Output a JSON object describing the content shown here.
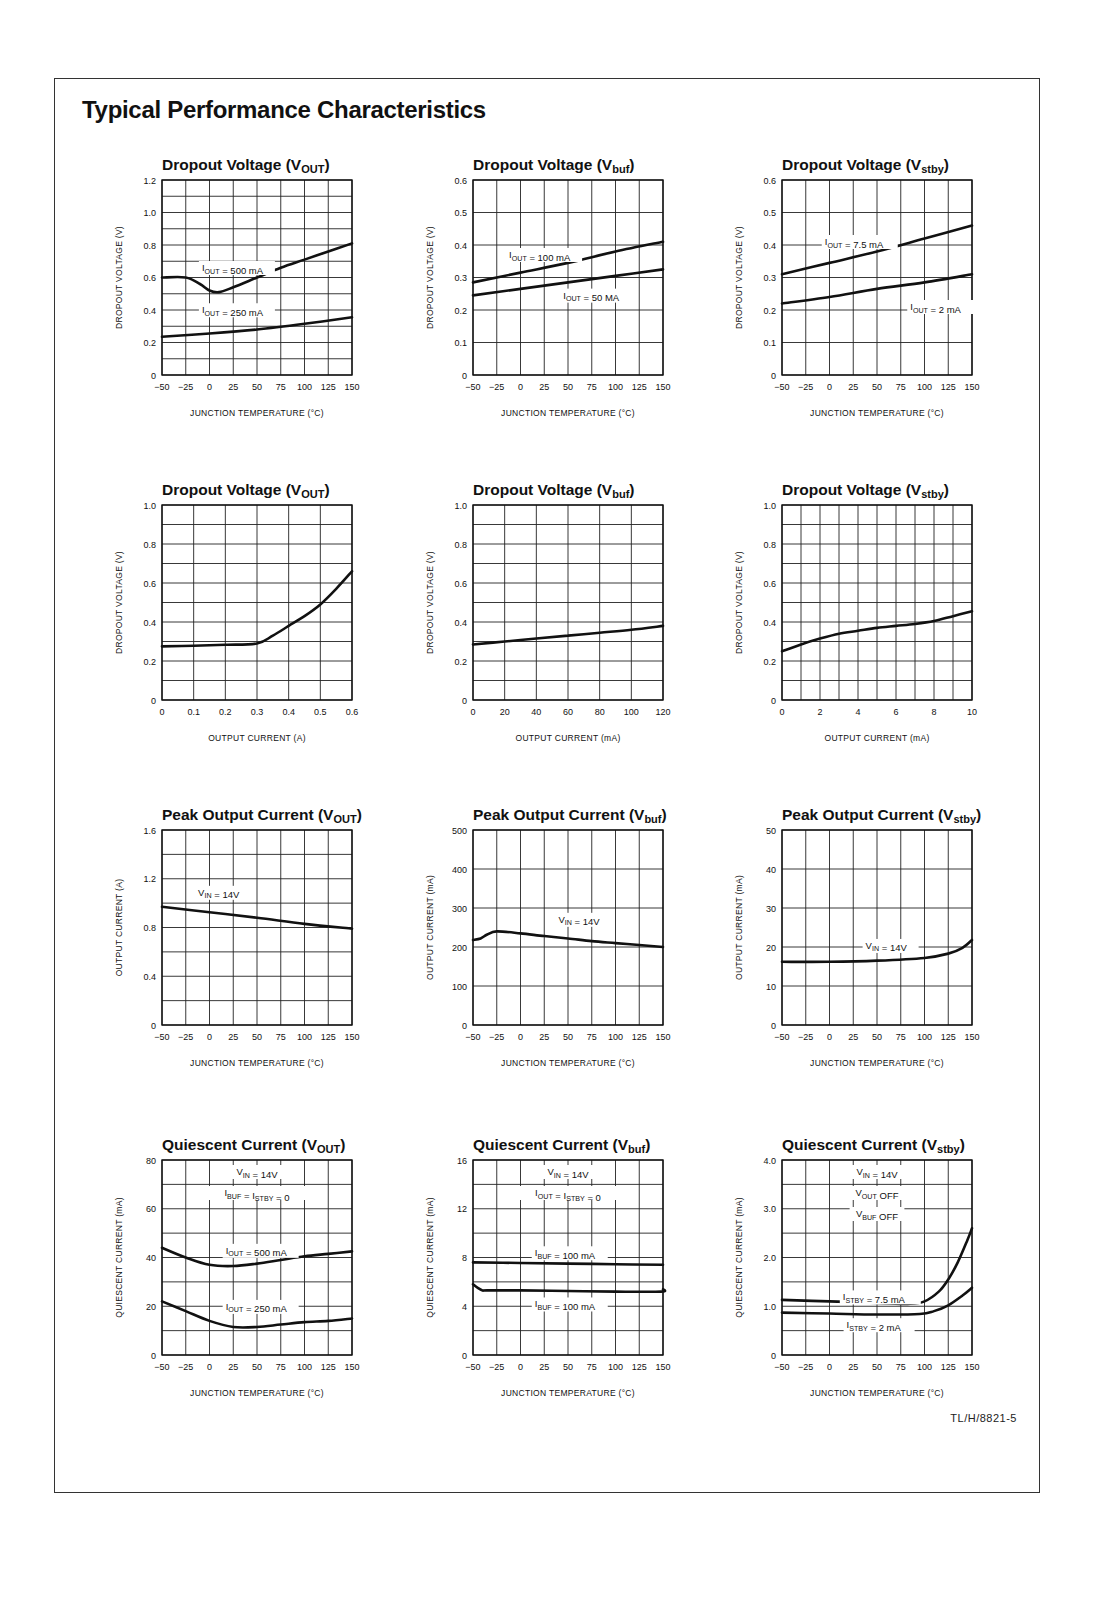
{
  "page": {
    "title": "Typical Performance Characteristics",
    "footer_code": "TL/H/8821-5"
  },
  "chart_data": [
    {
      "id": "dropout-vout-temp",
      "type": "line",
      "title": "Dropout Voltage (V_OUT)",
      "title_main": "Dropout Voltage (V",
      "title_sub": "OUT",
      "xlabel": "JUNCTION TEMPERATURE (°C)",
      "ylabel": "DROPOUT VOLTAGE (V)",
      "xlim": [
        -50,
        150
      ],
      "ylim": [
        0,
        1.2
      ],
      "xticks": [
        "-50",
        "-25",
        "0",
        "25",
        "50",
        "75",
        "100",
        "125",
        "150"
      ],
      "yticks": [
        "0",
        "0.2",
        "0.4",
        "0.6",
        "0.8",
        "1.0",
        "1.2"
      ],
      "grid": {
        "x_div": 8,
        "y_div": 12,
        "label_every": 2
      },
      "series": [
        {
          "name": "I_OUT = 500 mA",
          "x": [
            -50,
            -25,
            -10,
            0,
            10,
            25,
            50,
            75,
            100,
            125,
            150
          ],
          "y": [
            0.6,
            0.6,
            0.56,
            0.52,
            0.51,
            0.54,
            0.6,
            0.66,
            0.71,
            0.76,
            0.81
          ],
          "label_pos": [
            -8,
            0.64
          ]
        },
        {
          "name": "I_OUT = 250 mA",
          "x": [
            -50,
            0,
            50,
            100,
            150
          ],
          "y": [
            0.235,
            0.255,
            0.28,
            0.315,
            0.355
          ],
          "label_pos": [
            -8,
            0.38
          ]
        }
      ]
    },
    {
      "id": "dropout-vbuf-temp",
      "type": "line",
      "title": "Dropout Voltage (V_buf)",
      "title_main": "Dropout Voltage (V",
      "title_sub": "buf",
      "xlabel": "JUNCTION TEMPERATURE (°C)",
      "ylabel": "DROPOUT VOLTAGE (V)",
      "xlim": [
        -50,
        150
      ],
      "ylim": [
        0,
        0.6
      ],
      "xticks": [
        "-50",
        "-25",
        "0",
        "25",
        "50",
        "75",
        "100",
        "125",
        "150"
      ],
      "yticks": [
        "0",
        "0.1",
        "0.2",
        "0.3",
        "0.4",
        "0.5",
        "0.6"
      ],
      "grid": {
        "x_div": 8,
        "y_div": 6,
        "label_every": 1
      },
      "series": [
        {
          "name": "I_OUT = 100 mA",
          "x": [
            -50,
            0,
            50,
            100,
            150
          ],
          "y": [
            0.285,
            0.315,
            0.345,
            0.38,
            0.41
          ],
          "label_pos": [
            -12,
            0.36
          ]
        },
        {
          "name": "I_OUT = 50 MA",
          "x": [
            -50,
            0,
            50,
            100,
            150
          ],
          "y": [
            0.245,
            0.265,
            0.285,
            0.305,
            0.325
          ],
          "label_pos": [
            45,
            0.235
          ]
        }
      ]
    },
    {
      "id": "dropout-vstby-temp",
      "type": "line",
      "title": "Dropout Voltage (V_stby)",
      "title_main": "Dropout Voltage (V",
      "title_sub": "stby",
      "xlabel": "JUNCTION TEMPERATURE (°C)",
      "ylabel": "DROPOUT VOLTAGE (V)",
      "xlim": [
        -50,
        150
      ],
      "ylim": [
        0,
        0.6
      ],
      "xticks": [
        "-50",
        "-25",
        "0",
        "25",
        "50",
        "75",
        "100",
        "125",
        "150"
      ],
      "yticks": [
        "0",
        "0.1",
        "0.2",
        "0.3",
        "0.4",
        "0.5",
        "0.6"
      ],
      "grid": {
        "x_div": 8,
        "y_div": 6,
        "label_every": 1
      },
      "series": [
        {
          "name": "I_OUT = 7.5 mA",
          "x": [
            -50,
            0,
            50,
            100,
            150
          ],
          "y": [
            0.31,
            0.345,
            0.38,
            0.42,
            0.46
          ],
          "label_pos": [
            -5,
            0.4
          ]
        },
        {
          "name": "I_OUT = 2 mA",
          "x": [
            -50,
            0,
            50,
            100,
            150
          ],
          "y": [
            0.22,
            0.24,
            0.265,
            0.285,
            0.31
          ],
          "label_pos": [
            85,
            0.2
          ]
        }
      ]
    },
    {
      "id": "dropout-vout-current",
      "type": "line",
      "title": "Dropout Voltage (V_OUT)",
      "title_main": "Dropout Voltage (V",
      "title_sub": "OUT",
      "xlabel": "OUTPUT CURRENT (A)",
      "ylabel": "DROPOUT VOLTAGE (V)",
      "xlim": [
        0,
        0.6
      ],
      "ylim": [
        0,
        1.0
      ],
      "xticks": [
        "0",
        "0.1",
        "0.2",
        "0.3",
        "0.4",
        "0.5",
        "0.6"
      ],
      "yticks": [
        "0",
        "0.2",
        "0.4",
        "0.6",
        "0.8",
        "1.0"
      ],
      "grid": {
        "x_div": 6,
        "y_div": 10,
        "label_every": 2
      },
      "series": [
        {
          "name": "Dropout",
          "x": [
            0,
            0.1,
            0.2,
            0.3,
            0.35,
            0.4,
            0.45,
            0.5,
            0.55,
            0.6
          ],
          "y": [
            0.275,
            0.278,
            0.283,
            0.29,
            0.33,
            0.38,
            0.43,
            0.49,
            0.57,
            0.66
          ]
        }
      ]
    },
    {
      "id": "dropout-vbuf-current",
      "type": "line",
      "title": "Dropout Voltage (V_buf)",
      "title_main": "Dropout Voltage (V",
      "title_sub": "buf",
      "xlabel": "OUTPUT CURRENT (mA)",
      "ylabel": "DROPOUT VOLTAGE (V)",
      "xlim": [
        0,
        120
      ],
      "ylim": [
        0,
        1.0
      ],
      "xticks": [
        "0",
        "20",
        "40",
        "60",
        "80",
        "100",
        "120"
      ],
      "yticks": [
        "0",
        "0.2",
        "0.4",
        "0.6",
        "0.8",
        "1.0"
      ],
      "grid": {
        "x_div": 6,
        "y_div": 10,
        "label_every": 2
      },
      "series": [
        {
          "name": "Dropout",
          "x": [
            0,
            20,
            40,
            60,
            80,
            100,
            120
          ],
          "y": [
            0.285,
            0.3,
            0.315,
            0.33,
            0.345,
            0.36,
            0.38
          ]
        }
      ]
    },
    {
      "id": "dropout-vstby-current",
      "type": "line",
      "title": "Dropout Voltage (V_stby)",
      "title_main": "Dropout Voltage (V",
      "title_sub": "stby",
      "xlabel": "OUTPUT CURRENT (mA)",
      "ylabel": "DROPOUT VOLTAGE (V)",
      "xlim": [
        0,
        10
      ],
      "ylim": [
        0,
        1.0
      ],
      "xticks": [
        "0",
        "2",
        "4",
        "6",
        "8",
        "10"
      ],
      "yticks": [
        "0",
        "0.2",
        "0.4",
        "0.6",
        "0.8",
        "1.0"
      ],
      "grid": {
        "x_div": 10,
        "y_div": 10,
        "label_every": 2,
        "x_label_every": 2
      },
      "series": [
        {
          "name": "Dropout",
          "x": [
            0,
            1,
            2,
            3,
            4,
            5,
            6,
            7,
            8,
            9,
            10
          ],
          "y": [
            0.25,
            0.285,
            0.315,
            0.34,
            0.355,
            0.37,
            0.38,
            0.39,
            0.405,
            0.43,
            0.455
          ]
        }
      ]
    },
    {
      "id": "peak-vout",
      "type": "line",
      "title": "Peak Output Current (V_OUT)",
      "title_main": "Peak Output Current (V",
      "title_sub": "OUT",
      "xlabel": "JUNCTION TEMPERATURE (°C)",
      "ylabel": "OUTPUT CURRENT (A)",
      "xlim": [
        -50,
        150
      ],
      "ylim": [
        0,
        1.6
      ],
      "xticks": [
        "-50",
        "-25",
        "0",
        "25",
        "50",
        "75",
        "100",
        "125",
        "150"
      ],
      "yticks": [
        "0",
        "0.4",
        "0.8",
        "1.2",
        "1.6"
      ],
      "grid": {
        "x_div": 8,
        "y_div": 8,
        "label_every": 2
      },
      "series": [
        {
          "name": "V_IN = 14V",
          "x": [
            -50,
            0,
            50,
            100,
            150
          ],
          "y": [
            0.97,
            0.925,
            0.88,
            0.83,
            0.79
          ],
          "label_pos": [
            -12,
            1.06
          ]
        }
      ]
    },
    {
      "id": "peak-vbuf",
      "type": "line",
      "title": "Peak Output Current (V_buf)",
      "title_main": "Peak Output Current (V",
      "title_sub": "buf",
      "xlabel": "JUNCTION TEMPERATURE (°C)",
      "ylabel": "OUTPUT CURRENT (mA)",
      "xlim": [
        -50,
        150
      ],
      "ylim": [
        0,
        500
      ],
      "xticks": [
        "-50",
        "-25",
        "0",
        "25",
        "50",
        "75",
        "100",
        "125",
        "150"
      ],
      "yticks": [
        "0",
        "100",
        "200",
        "300",
        "400",
        "500"
      ],
      "grid": {
        "x_div": 8,
        "y_div": 5,
        "label_every": 1
      },
      "series": [
        {
          "name": "V_IN = 14V",
          "x": [
            -50,
            -42,
            -35,
            -25,
            0,
            25,
            50,
            75,
            100,
            125,
            150
          ],
          "y": [
            218,
            222,
            232,
            240,
            235,
            228,
            222,
            215,
            210,
            205,
            200
          ],
          "label_pos": [
            40,
            262
          ]
        }
      ]
    },
    {
      "id": "peak-vstby",
      "type": "line",
      "title": "Peak Output Current (V_stby)",
      "title_main": "Peak Output Current (V",
      "title_sub": "stby",
      "xlabel": "JUNCTION TEMPERATURE (°C)",
      "ylabel": "OUTPUT CURRENT (mA)",
      "xlim": [
        -50,
        150
      ],
      "ylim": [
        0,
        50
      ],
      "xticks": [
        "-50",
        "-25",
        "0",
        "25",
        "50",
        "75",
        "100",
        "125",
        "150"
      ],
      "yticks": [
        "0",
        "10",
        "20",
        "30",
        "40",
        "50"
      ],
      "grid": {
        "x_div": 8,
        "y_div": 5,
        "label_every": 1
      },
      "series": [
        {
          "name": "V_IN = 14V",
          "x": [
            -50,
            0,
            50,
            100,
            125,
            140,
            150
          ],
          "y": [
            16.2,
            16.2,
            16.5,
            17.2,
            18.3,
            19.8,
            21.8
          ],
          "label_pos": [
            38,
            19.5
          ]
        }
      ]
    },
    {
      "id": "quiescent-vout",
      "type": "line",
      "title": "Quiescent Current (V_OUT)",
      "title_main": "Quiescent Current (V",
      "title_sub": "OUT",
      "xlabel": "JUNCTION TEMPERATURE (°C)",
      "ylabel": "QUIESCENT CURRENT (mA)",
      "xlim": [
        -50,
        150
      ],
      "ylim": [
        0,
        80
      ],
      "xticks": [
        "-50",
        "-25",
        "0",
        "25",
        "50",
        "75",
        "100",
        "125",
        "150"
      ],
      "yticks": [
        "0",
        "20",
        "40",
        "60",
        "80"
      ],
      "grid": {
        "x_div": 8,
        "y_div": 8,
        "label_every": 2
      },
      "annotations": [
        "V_IN = 14V",
        "I_BUF = I_STBY = 0"
      ],
      "series": [
        {
          "name": "I_OUT = 500 mA",
          "x": [
            -50,
            -25,
            0,
            25,
            50,
            75,
            100,
            125,
            150
          ],
          "y": [
            44,
            40,
            37,
            36.5,
            37.5,
            39,
            40.5,
            41.5,
            42.5
          ],
          "label_pos": [
            17,
            41.5
          ]
        },
        {
          "name": "I_OUT = 250 mA",
          "x": [
            -50,
            -25,
            0,
            25,
            50,
            75,
            100,
            125,
            150
          ],
          "y": [
            22,
            18,
            14,
            11.5,
            11.5,
            12.5,
            13.5,
            14,
            15
          ],
          "label_pos": [
            17,
            18.5
          ]
        }
      ]
    },
    {
      "id": "quiescent-vbuf",
      "type": "line",
      "title": "Quiescent Current (V_buf)",
      "title_main": "Quiescent Current (V",
      "title_sub": "buf",
      "xlabel": "JUNCTION TEMPERATURE (°C)",
      "ylabel": "QUIESCENT CURRENT (mA)",
      "xlim": [
        -50,
        150
      ],
      "ylim": [
        0,
        16
      ],
      "xticks": [
        "-50",
        "-25",
        "0",
        "25",
        "50",
        "75",
        "100",
        "125",
        "150"
      ],
      "yticks": [
        "0",
        "4",
        "8",
        "12",
        "16"
      ],
      "grid": {
        "x_div": 8,
        "y_div": 8,
        "label_every": 2
      },
      "annotations": [
        "V_IN = 14V",
        "I_OUT = I_STBY = 0"
      ],
      "series": [
        {
          "name": "I_BUF = 100 mA",
          "x": [
            -50,
            0,
            50,
            100,
            150
          ],
          "y": [
            7.6,
            7.55,
            7.5,
            7.45,
            7.4
          ],
          "label_pos": [
            15,
            8.1
          ]
        },
        {
          "name": "I_BUF = 100 mA",
          "x": [
            -50,
            -45,
            -40,
            -35,
            0,
            50,
            100,
            148,
            150
          ],
          "y": [
            5.8,
            5.5,
            5.3,
            5.3,
            5.3,
            5.25,
            5.2,
            5.2,
            5.4
          ],
          "label_pos": [
            15,
            3.9
          ]
        }
      ]
    },
    {
      "id": "quiescent-vstby",
      "type": "line",
      "title": "Quiescent Current (V_stby)",
      "title_main": "Quiescent Current (V",
      "title_sub": "stby",
      "xlabel": "JUNCTION TEMPERATURE (°C)",
      "ylabel": "QUIESCENT CURRENT (mA)",
      "xlim": [
        -50,
        150
      ],
      "ylim": [
        0,
        4.0
      ],
      "xticks": [
        "-50",
        "-25",
        "0",
        "25",
        "50",
        "75",
        "100",
        "125",
        "150"
      ],
      "yticks": [
        "0",
        "1.0",
        "2.0",
        "3.0",
        "4.0"
      ],
      "grid": {
        "x_div": 8,
        "y_div": 8,
        "label_every": 2
      },
      "annotations": [
        "V_IN = 14V",
        "V_OUT OFF",
        "V_BUF OFF"
      ],
      "series": [
        {
          "name": "I_STBY = 7.5 mA",
          "x": [
            -50,
            0,
            50,
            85,
            100,
            115,
            125,
            135,
            145,
            150
          ],
          "y": [
            1.13,
            1.1,
            1.07,
            1.05,
            1.1,
            1.3,
            1.55,
            1.9,
            2.35,
            2.6
          ],
          "label_pos": [
            14,
            1.12
          ]
        },
        {
          "name": "I_STBY = 2 mA",
          "x": [
            -50,
            0,
            50,
            95,
            110,
            125,
            140,
            150
          ],
          "y": [
            0.87,
            0.85,
            0.83,
            0.84,
            0.9,
            1.02,
            1.22,
            1.38
          ],
          "label_pos": [
            18,
            0.55
          ]
        }
      ]
    }
  ]
}
